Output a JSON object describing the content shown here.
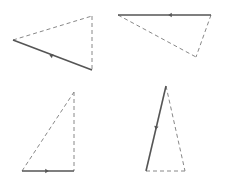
{
  "canvas": {
    "width": 225,
    "height": 188,
    "background": "#ffffff"
  },
  "style": {
    "solid_color": "#555555",
    "dashed_color": "#888888",
    "solid_width": 1.6,
    "dashed_width": 1,
    "dash": "4,3"
  },
  "triangles": [
    {
      "name": "triangle-top-left",
      "solid": {
        "x1": 13,
        "y1": 40,
        "x2": 92,
        "y2": 70,
        "arrow": {
          "x": 51,
          "y": 55.5,
          "direction": "toward-start"
        }
      },
      "dashed": [
        {
          "x1": 13,
          "y1": 40,
          "x2": 92,
          "y2": 16
        },
        {
          "x1": 92,
          "y1": 16,
          "x2": 92,
          "y2": 70
        }
      ]
    },
    {
      "name": "triangle-top-right",
      "solid": {
        "x1": 118,
        "y1": 15,
        "x2": 211,
        "y2": 15,
        "arrow": {
          "x": 170,
          "y": 15,
          "direction": "toward-start"
        }
      },
      "dashed": [
        {
          "x1": 118,
          "y1": 15,
          "x2": 196,
          "y2": 57
        },
        {
          "x1": 211,
          "y1": 15,
          "x2": 196,
          "y2": 57
        }
      ]
    },
    {
      "name": "triangle-bottom-left",
      "solid": {
        "x1": 22,
        "y1": 171,
        "x2": 74,
        "y2": 171,
        "arrow": {
          "x": 47,
          "y": 171,
          "direction": "toward-end"
        }
      },
      "dashed": [
        {
          "x1": 22,
          "y1": 171,
          "x2": 74,
          "y2": 92
        },
        {
          "x1": 74,
          "y1": 92,
          "x2": 74,
          "y2": 171
        }
      ]
    },
    {
      "name": "triangle-bottom-right",
      "solid": {
        "x1": 166,
        "y1": 86,
        "x2": 146,
        "y2": 171,
        "arrow": {
          "x": 156,
          "y": 128,
          "direction": "toward-end"
        }
      },
      "dashed": [
        {
          "x1": 166,
          "y1": 86,
          "x2": 185,
          "y2": 171
        },
        {
          "x1": 146,
          "y1": 171,
          "x2": 185,
          "y2": 171
        }
      ]
    }
  ]
}
